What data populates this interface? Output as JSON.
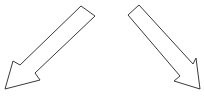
{
  "diagram": {
    "background": "#ffffff",
    "stroke_color": "#3a3a3a",
    "fill_color": "#ffffff",
    "arrows": [
      {
        "name": "arrow-down-left",
        "direction": "down-left",
        "points": "81,6 95,16 35,73 40,80 5,89 13,61 20,65"
      },
      {
        "name": "arrow-down-right",
        "direction": "down-right",
        "points": "128,15 139,5 193,64 196,58 200,89 174,81 180,76"
      }
    ]
  }
}
